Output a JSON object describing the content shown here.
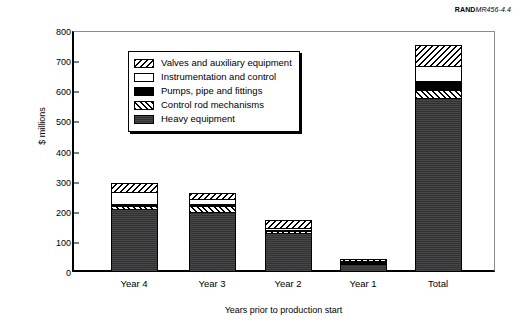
{
  "source_credit": {
    "brand": "RAND",
    "document": "MR456-4.4"
  },
  "chart_data": {
    "type": "bar",
    "subtype": "stacked-bar",
    "title": "",
    "xlabel": "Years prior to production start",
    "ylabel": "$ millions",
    "ylim": [
      0,
      800
    ],
    "yticks": [
      0,
      100,
      200,
      300,
      400,
      500,
      600,
      700,
      800
    ],
    "ytick_labels": [
      "0",
      "100",
      "200",
      "300",
      "400",
      "500",
      "600",
      "700",
      "800"
    ],
    "grid": false,
    "legend_position": "upper-left-inside",
    "categories": [
      "Year 4",
      "Year 3",
      "Year 2",
      "Year 1",
      "Total"
    ],
    "series": [
      {
        "name": "Heavy equipment",
        "pattern": "solid-dark-gray",
        "color": "#39393b",
        "values": [
          210,
          202,
          133,
          33,
          578
        ]
      },
      {
        "name": "Control rod mechanisms",
        "pattern": "forward-diagonal-hatch",
        "color": "#ffffff",
        "values": [
          11,
          20,
          6,
          4,
          29
        ]
      },
      {
        "name": "Pumps, pipe and fittings",
        "pattern": "solid-black",
        "color": "#000000",
        "values": [
          6,
          6,
          4,
          2,
          28
        ]
      },
      {
        "name": "Instrumentation and control",
        "pattern": "white-empty",
        "color": "#ffffff",
        "values": [
          41,
          16,
          7,
          1,
          53
        ]
      },
      {
        "name": "Valves and auxiliary equipment",
        "pattern": "backward-diagonal-hatch",
        "color": "#ffffff",
        "values": [
          27,
          19,
          23,
          3,
          64
        ]
      }
    ],
    "totals": [
      295,
      263,
      173,
      43,
      752
    ]
  },
  "legend": {
    "items": [
      {
        "label": "Valves and auxiliary equipment",
        "swatch": "backward-diagonal-hatch"
      },
      {
        "label": "Instrumentation and control",
        "swatch": "white-empty"
      },
      {
        "label": "Pumps, pipe and fittings",
        "swatch": "solid-black"
      },
      {
        "label": "Control rod mechanisms",
        "swatch": "forward-diagonal-hatch"
      },
      {
        "label": "Heavy equipment",
        "swatch": "solid-dark-gray"
      }
    ]
  }
}
